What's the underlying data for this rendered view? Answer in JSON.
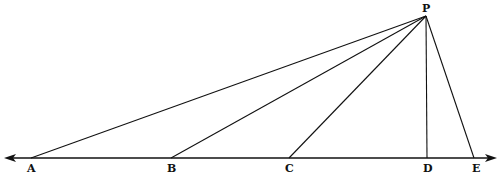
{
  "diagram": {
    "title": "",
    "points": [
      {
        "id": "P",
        "label": "P",
        "x": 426,
        "y": 16,
        "lx": 422,
        "ly": 12
      },
      {
        "id": "A",
        "label": "A",
        "x": 31,
        "y": 158,
        "lx": 27,
        "ly": 172
      },
      {
        "id": "B",
        "label": "B",
        "x": 171,
        "y": 158,
        "lx": 167,
        "ly": 172
      },
      {
        "id": "C",
        "label": "C",
        "x": 289,
        "y": 158,
        "lx": 285,
        "ly": 172
      },
      {
        "id": "D",
        "label": "D",
        "x": 427,
        "y": 158,
        "lx": 423,
        "ly": 172
      },
      {
        "id": "E",
        "label": "E",
        "x": 474,
        "y": 158,
        "lx": 472,
        "ly": 172
      }
    ],
    "segments": [
      [
        "P",
        "A"
      ],
      [
        "P",
        "B"
      ],
      [
        "P",
        "C"
      ],
      [
        "P",
        "D"
      ],
      [
        "P",
        "E"
      ]
    ],
    "baseline": {
      "x1": 4,
      "x2": 497,
      "y": 158,
      "arrows": "both"
    },
    "stroke_color": "#111111"
  }
}
